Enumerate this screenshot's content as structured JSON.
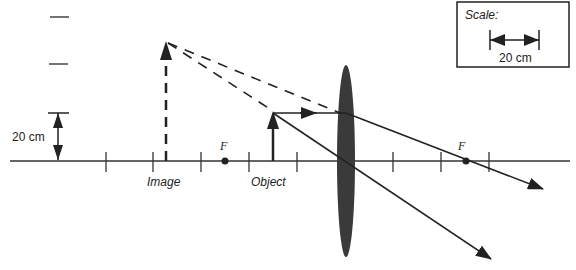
{
  "diagram": {
    "type": "ray-diagram-converging-lens",
    "colors": {
      "ink": "#222222",
      "lens": "#333333",
      "background": "#ffffff"
    },
    "scale_box": {
      "title": "Scale:",
      "length_label": "20 cm"
    },
    "height_marker": {
      "label": "20 cm"
    },
    "labels": {
      "image": "Image",
      "object": "Object",
      "focal_left": "F",
      "focal_right": "F"
    },
    "elements": {
      "optical_axis": "principal axis",
      "lens": "converging lens",
      "object_arrow": "real object, upright",
      "image_arrow": "virtual image, upright, dashed",
      "rays": [
        "parallel ray refracted through F",
        "ray through lens center",
        "dashed back-extensions to virtual image"
      ]
    }
  }
}
